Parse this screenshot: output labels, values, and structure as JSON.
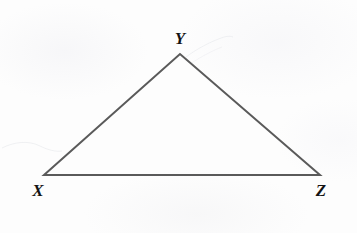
{
  "figure": {
    "kind": "geometry-diagram",
    "background_color": "#fdfdfd",
    "stroke_color": "#5a5a5a",
    "stroke_width": 2,
    "label_color": "#141414",
    "canvas": {
      "width": 357,
      "height": 233
    }
  },
  "triangle": {
    "name": "triangle-xyz",
    "vertices": [
      {
        "id": "X",
        "label": "X",
        "x": 44,
        "y": 175,
        "label_x": 38,
        "label_y": 190
      },
      {
        "id": "Y",
        "label": "Y",
        "x": 180,
        "y": 54,
        "label_x": 180,
        "label_y": 38
      },
      {
        "id": "Z",
        "label": "Z",
        "x": 320,
        "y": 175,
        "label_x": 321,
        "label_y": 190
      }
    ],
    "edges": [
      {
        "id": "XY",
        "from": "X",
        "to": "Y"
      },
      {
        "id": "YZ",
        "from": "Y",
        "to": "Z"
      },
      {
        "id": "ZX",
        "from": "Z",
        "to": "X"
      }
    ],
    "points_path": "44,175 180,54 320,175"
  },
  "stray_marks": [
    {
      "id": "left-smudge",
      "path": "M 2,148 C 14,142 28,140 40,146 C 48,150 56,152 62,151",
      "opacity": 0.14
    },
    {
      "id": "apex-smudge",
      "path": "M 186,57 C 198,48 212,41 224,37 C 228,36 231,36 233,37",
      "opacity": 0.13
    },
    {
      "id": "apex-smudge-2",
      "path": "M 190,64 C 202,56 214,50 222,47",
      "opacity": 0.09
    }
  ]
}
